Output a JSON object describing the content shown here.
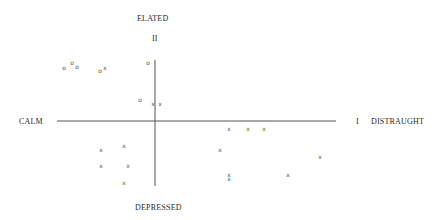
{
  "chart_data": {
    "type": "scatter",
    "title": "",
    "axes": {
      "x": {
        "negative_label": "CALM",
        "positive_label": "DISTRAUGHT",
        "positive_end_marker": "I"
      },
      "y": {
        "positive_label": "ELATED",
        "negative_label": "DEPRESSED",
        "positive_end_marker": "II"
      }
    },
    "grid": false,
    "legend": null,
    "origin_px": [
      155,
      121
    ],
    "series": [
      {
        "name": "o",
        "marker": "o",
        "points_px": [
          [
            64,
            68
          ],
          [
            72,
            63
          ],
          [
            77,
            67
          ],
          [
            100,
            71
          ],
          [
            148,
            63
          ],
          [
            140,
            100
          ]
        ]
      },
      {
        "name": "x",
        "marker": "x",
        "points_px": [
          [
            105,
            68
          ],
          [
            153,
            104
          ],
          [
            160,
            104
          ],
          [
            124,
            146
          ],
          [
            101,
            150
          ],
          [
            128,
            166
          ],
          [
            101,
            166
          ],
          [
            124,
            183
          ],
          [
            229,
            129
          ],
          [
            248,
            129
          ],
          [
            264,
            129
          ],
          [
            220,
            150
          ],
          [
            320,
            157
          ],
          [
            288,
            175
          ],
          [
            229,
            175
          ],
          [
            229,
            179
          ]
        ]
      }
    ]
  },
  "labels": {
    "top": "ELATED",
    "top_marker": "II",
    "left": "CALM",
    "right_marker": "I",
    "right": "DISTRAUGHT",
    "bottom": "DEPRESSED"
  }
}
